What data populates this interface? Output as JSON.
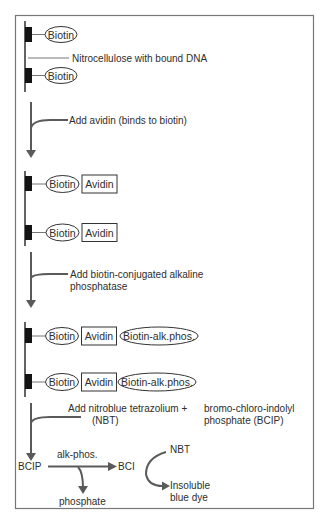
{
  "diagram": {
    "colors": {
      "line": "#5a5a5a",
      "block": "#141414",
      "frame": "#777777",
      "text": "#2e2e2e"
    },
    "stage1": {
      "molecules": [
        "Biotin",
        "Biotin"
      ],
      "membrane_label": "Nitrocellulose with bound DNA"
    },
    "step1": {
      "label": "Add avidin (binds to biotin)"
    },
    "stage2": {
      "rows": [
        {
          "biotin": "Biotin",
          "avidin": "Avidin"
        },
        {
          "biotin": "Biotin",
          "avidin": "Avidin"
        }
      ]
    },
    "step2": {
      "label_line1": "Add biotin-conjugated alkaline",
      "label_line2": "phosphatase"
    },
    "stage3": {
      "rows": [
        {
          "biotin": "Biotin",
          "avidin": "Avidin",
          "enzyme": "Biotin-alk.phos."
        },
        {
          "biotin": "Biotin",
          "avidin": "Avidin",
          "enzyme": "Biotin-alk.phos."
        }
      ]
    },
    "step3": {
      "line1_left": "Add nitroblue tetrazolium +",
      "line2_left": "(NBT)",
      "line1_right": "bromo-chloro-indolyl",
      "line2_right": "phosphate (BCIP)"
    },
    "reaction": {
      "substrate": "BCIP",
      "enzyme_label": "alk-phos.",
      "product": "BCI",
      "byproduct": "phosphate",
      "reagent": "NBT",
      "result_line1": "Insoluble",
      "result_line2": "blue dye"
    }
  }
}
